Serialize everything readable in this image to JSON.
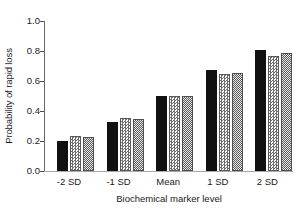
{
  "chart_data": {
    "type": "bar",
    "title": "",
    "xlabel": "Biochemical marker level",
    "ylabel": "Probability of rapid loss",
    "categories": [
      "-2 SD",
      "-1 SD",
      "Mean",
      "1 SD",
      "2 SD"
    ],
    "ylim": [
      0.0,
      1.0
    ],
    "yticks": [
      "0.0",
      "0.2",
      "0.4",
      "0.6",
      "0.8",
      "1.0"
    ],
    "ytick_values": [
      0.0,
      0.2,
      0.4,
      0.6,
      0.8,
      1.0
    ],
    "grid": false,
    "legend": "none",
    "series": [
      {
        "name": "series-1",
        "pattern": "solid-black",
        "values": [
          0.2,
          0.325,
          0.5,
          0.675,
          0.805
        ]
      },
      {
        "name": "series-2",
        "pattern": "light-checker",
        "values": [
          0.235,
          0.355,
          0.5,
          0.645,
          0.765
        ]
      },
      {
        "name": "series-3",
        "pattern": "dark-checker",
        "values": [
          0.225,
          0.35,
          0.5,
          0.655,
          0.785
        ]
      }
    ]
  }
}
